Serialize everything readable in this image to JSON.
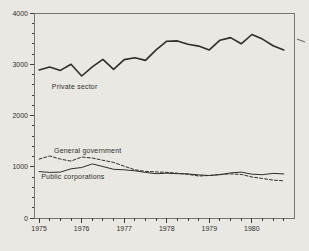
{
  "chart_data": {
    "type": "line",
    "title": "",
    "xlabel": "",
    "ylabel": "",
    "x_unit": "year, quarterly data points",
    "x": [
      1975.0,
      1975.25,
      1975.5,
      1975.75,
      1976.0,
      1976.25,
      1976.5,
      1976.75,
      1977.0,
      1977.25,
      1977.5,
      1977.75,
      1978.0,
      1978.25,
      1978.5,
      1978.75,
      1979.0,
      1979.25,
      1979.5,
      1979.75,
      1980.0,
      1980.25,
      1980.5,
      1980.75
    ],
    "series": [
      {
        "name": "Private sector",
        "style": "solid-thick",
        "values": [
          2890,
          2945,
          2880,
          3000,
          2770,
          2950,
          3095,
          2900,
          3090,
          3125,
          3075,
          3280,
          3450,
          3455,
          3390,
          3355,
          3280,
          3470,
          3520,
          3400,
          3580,
          3490,
          3360,
          3280
        ]
      },
      {
        "name": "General government",
        "style": "dashed",
        "values": [
          1150,
          1210,
          1150,
          1110,
          1190,
          1170,
          1125,
          1085,
          1010,
          940,
          910,
          900,
          890,
          875,
          850,
          820,
          830,
          850,
          860,
          850,
          800,
          770,
          740,
          725
        ]
      },
      {
        "name": "Public corporations",
        "style": "solid-thin",
        "values": [
          905,
          890,
          895,
          960,
          985,
          1055,
          1005,
          950,
          940,
          920,
          890,
          865,
          875,
          865,
          860,
          840,
          830,
          845,
          880,
          895,
          855,
          845,
          870,
          860
        ]
      }
    ],
    "ylim": [
      0,
      4000
    ],
    "xlim": [
      1974.88,
      1980.99
    ],
    "y_major_ticks": [
      0,
      1000,
      2000,
      3000,
      4000
    ],
    "y_tick_labels": [
      "0",
      "1000",
      "2000",
      "3000",
      "4000"
    ],
    "y_minor_step": 200,
    "x_major_ticks": [
      1975,
      1976,
      1977,
      1978,
      1979,
      1980
    ],
    "x_tick_labels": [
      "1975",
      "1976",
      "1977",
      "1978",
      "1979",
      "1980"
    ],
    "x_minor_step": 0.25,
    "grid": false,
    "legend_position": "inline-labels",
    "annotations": [
      {
        "text": "Private sector",
        "x": 1975.3,
        "y": 2565
      },
      {
        "text": "General government",
        "x": 1975.35,
        "y": 1310
      },
      {
        "text": "Public corporations",
        "x": 1975.05,
        "y": 800
      }
    ],
    "colors": {
      "line": "#2e2e2c",
      "frame": "#77776f",
      "background": "#e9e8e3",
      "text": "#2f2f2d"
    }
  }
}
